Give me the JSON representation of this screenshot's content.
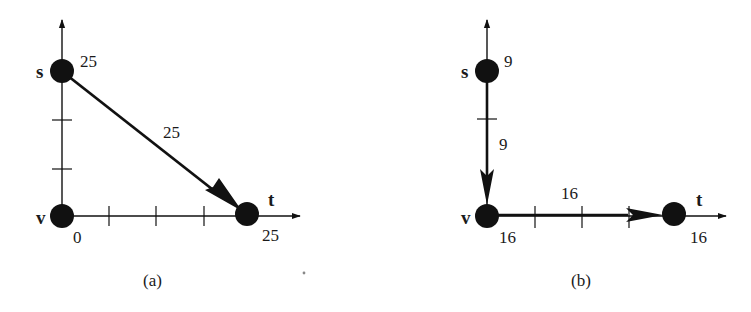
{
  "figure": {
    "panels": [
      {
        "id": "a",
        "caption": "(a)",
        "nodes": {
          "s": {
            "name": "s",
            "value": "25"
          },
          "v": {
            "name": "v",
            "value": "0"
          },
          "t": {
            "name": "t",
            "value": "25"
          }
        },
        "edges": [
          {
            "from": "s",
            "to": "t",
            "label": "25"
          }
        ]
      },
      {
        "id": "b",
        "caption": "(b)",
        "nodes": {
          "s": {
            "name": "s",
            "value": "9"
          },
          "v": {
            "name": "v",
            "value": "16"
          },
          "t": {
            "name": "t",
            "value": "16"
          }
        },
        "edges": [
          {
            "from": "s",
            "to": "v",
            "label": "9"
          },
          {
            "from": "v",
            "to": "t",
            "label": "16"
          }
        ]
      }
    ],
    "colors": {
      "ink": "#111111",
      "background": "#ffffff"
    }
  }
}
